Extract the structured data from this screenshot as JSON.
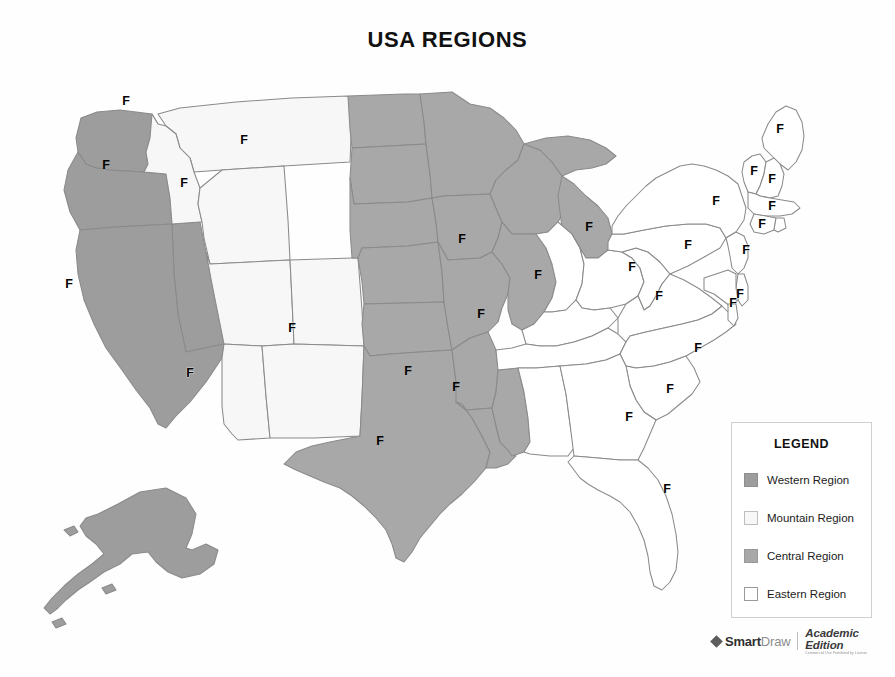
{
  "page": {
    "title": "USA REGIONS",
    "background_color": "#ffffff"
  },
  "colors": {
    "western_region": "#9d9d9d",
    "mountain_region": "#f7f7f7",
    "central_region": "#a8a8a8",
    "eastern_region": "#ffffff",
    "state_border": "#8a8a8a",
    "label_text": "#000000",
    "legend_border": "#cfcfcf"
  },
  "legend": {
    "title": "LEGEND",
    "items": [
      {
        "label": "Western Region",
        "swatch": "#9d9d9d",
        "swatch_name": "swatch-western"
      },
      {
        "label": "Mountain Region",
        "swatch": "#f7f7f7",
        "swatch_name": "swatch-mountain"
      },
      {
        "label": "Central Region",
        "swatch": "#a8a8a8",
        "swatch_name": "swatch-central"
      },
      {
        "label": "Eastern Region",
        "swatch": "#ffffff",
        "swatch_name": "swatch-eastern"
      }
    ]
  },
  "watermark": {
    "brand_bold": "Smart",
    "brand_light": "Draw",
    "edition": "Academic Edition",
    "edition_sub": "Commercial Use Prohibited by License",
    "logo_icon": "diamond-icon"
  },
  "map_data": {
    "type": "choropleth-map",
    "projection": "usa-albers-like",
    "label_text": "F",
    "regions": [
      {
        "key": "west",
        "name": "Western Region",
        "fill": "#9d9d9d"
      },
      {
        "key": "mountain",
        "name": "Mountain Region",
        "fill": "#f7f7f7"
      },
      {
        "key": "central",
        "name": "Central Region",
        "fill": "#a8a8a8"
      },
      {
        "key": "east",
        "name": "Eastern Region",
        "fill": "#ffffff"
      }
    ],
    "states": [
      {
        "code": "WA",
        "name": "Washington",
        "region": "west",
        "label": "F",
        "lx": 126,
        "ly": 50
      },
      {
        "code": "OR",
        "name": "Oregon",
        "region": "west",
        "label": "F",
        "lx": 106,
        "ly": 114
      },
      {
        "code": "CA",
        "name": "California",
        "region": "west",
        "label": "F",
        "lx": 69,
        "ly": 233
      },
      {
        "code": "NV",
        "name": "Nevada",
        "region": "west",
        "label": "",
        "lx": 0,
        "ly": 0
      },
      {
        "code": "AK",
        "name": "Alaska",
        "region": "west",
        "label": "",
        "lx": 0,
        "ly": 0
      },
      {
        "code": "HI",
        "name": "Hawaii",
        "region": "west",
        "label": "",
        "lx": 0,
        "ly": 0
      },
      {
        "code": "ID",
        "name": "Idaho",
        "region": "mountain",
        "label": "F",
        "lx": 184,
        "ly": 132
      },
      {
        "code": "MT",
        "name": "Montana",
        "region": "mountain",
        "label": "F",
        "lx": 244,
        "ly": 89
      },
      {
        "code": "WY",
        "name": "Wyoming",
        "region": "mountain",
        "label": "",
        "lx": 0,
        "ly": 0
      },
      {
        "code": "UT",
        "name": "Utah",
        "region": "mountain",
        "label": "",
        "lx": 0,
        "ly": 0
      },
      {
        "code": "CO",
        "name": "Colorado",
        "region": "mountain",
        "label": "F",
        "lx": 292,
        "ly": 277
      },
      {
        "code": "AZ",
        "name": "Arizona",
        "region": "mountain",
        "label": "F",
        "lx": 190,
        "ly": 322
      },
      {
        "code": "NM",
        "name": "New Mexico",
        "region": "mountain",
        "label": "",
        "lx": 0,
        "ly": 0
      },
      {
        "code": "ND",
        "name": "North Dakota",
        "region": "central",
        "label": "",
        "lx": 0,
        "ly": 0
      },
      {
        "code": "SD",
        "name": "South Dakota",
        "region": "central",
        "label": "",
        "lx": 0,
        "ly": 0
      },
      {
        "code": "NE",
        "name": "Nebraska",
        "region": "central",
        "label": "",
        "lx": 0,
        "ly": 0
      },
      {
        "code": "KS",
        "name": "Kansas",
        "region": "central",
        "label": "",
        "lx": 0,
        "ly": 0
      },
      {
        "code": "OK",
        "name": "Oklahoma",
        "region": "central",
        "label": "F",
        "lx": 408,
        "ly": 320
      },
      {
        "code": "TX",
        "name": "Texas",
        "region": "central",
        "label": "F",
        "lx": 380,
        "ly": 390
      },
      {
        "code": "MN",
        "name": "Minnesota",
        "region": "central",
        "label": "",
        "lx": 0,
        "ly": 0
      },
      {
        "code": "IA",
        "name": "Iowa",
        "region": "central",
        "label": "F",
        "lx": 462,
        "ly": 188
      },
      {
        "code": "MO",
        "name": "Missouri",
        "region": "central",
        "label": "F",
        "lx": 481,
        "ly": 263
      },
      {
        "code": "AR",
        "name": "Arkansas",
        "region": "central",
        "label": "F",
        "lx": 456,
        "ly": 336
      },
      {
        "code": "LA",
        "name": "Louisiana",
        "region": "central",
        "label": "",
        "lx": 0,
        "ly": 0
      },
      {
        "code": "MS",
        "name": "Mississippi",
        "region": "central",
        "label": "",
        "lx": 0,
        "ly": 0
      },
      {
        "code": "WI",
        "name": "Wisconsin",
        "region": "central",
        "label": "",
        "lx": 0,
        "ly": 0
      },
      {
        "code": "IL",
        "name": "Illinois",
        "region": "central",
        "label": "F",
        "lx": 538,
        "ly": 224
      },
      {
        "code": "MI",
        "name": "Michigan",
        "region": "central",
        "label": "F",
        "lx": 589,
        "ly": 176
      },
      {
        "code": "IN",
        "name": "Indiana",
        "region": "east",
        "label": "",
        "lx": 0,
        "ly": 0
      },
      {
        "code": "OH",
        "name": "Ohio",
        "region": "east",
        "label": "F",
        "lx": 632,
        "ly": 216
      },
      {
        "code": "KY",
        "name": "Kentucky",
        "region": "east",
        "label": "",
        "lx": 0,
        "ly": 0
      },
      {
        "code": "TN",
        "name": "Tennessee",
        "region": "east",
        "label": "",
        "lx": 0,
        "ly": 0
      },
      {
        "code": "AL",
        "name": "Alabama",
        "region": "east",
        "label": "",
        "lx": 0,
        "ly": 0
      },
      {
        "code": "WV",
        "name": "West Virginia",
        "region": "east",
        "label": "F",
        "lx": 659,
        "ly": 245
      },
      {
        "code": "VA",
        "name": "Virginia",
        "region": "east",
        "label": "",
        "lx": 0,
        "ly": 0
      },
      {
        "code": "NC",
        "name": "North Carolina",
        "region": "east",
        "label": "F",
        "lx": 698,
        "ly": 297
      },
      {
        "code": "SC",
        "name": "South Carolina",
        "region": "east",
        "label": "F",
        "lx": 670,
        "ly": 338
      },
      {
        "code": "GA",
        "name": "Georgia",
        "region": "east",
        "label": "F",
        "lx": 629,
        "ly": 366
      },
      {
        "code": "FL",
        "name": "Florida",
        "region": "east",
        "label": "F",
        "lx": 667,
        "ly": 438
      },
      {
        "code": "PA",
        "name": "Pennsylvania",
        "region": "east",
        "label": "F",
        "lx": 688,
        "ly": 194
      },
      {
        "code": "NY",
        "name": "New York",
        "region": "east",
        "label": "F",
        "lx": 716,
        "ly": 150
      },
      {
        "code": "ME",
        "name": "Maine",
        "region": "east",
        "label": "F",
        "lx": 780,
        "ly": 78
      },
      {
        "code": "VT",
        "name": "Vermont",
        "region": "east",
        "label": "F",
        "lx": 754,
        "ly": 120
      },
      {
        "code": "NH",
        "name": "New Hampshire",
        "region": "east",
        "label": "F",
        "lx": 772,
        "ly": 128
      },
      {
        "code": "MA",
        "name": "Massachusetts",
        "region": "east",
        "label": "F",
        "lx": 772,
        "ly": 155
      },
      {
        "code": "CT",
        "name": "Connecticut",
        "region": "east",
        "label": "F",
        "lx": 762,
        "ly": 173
      },
      {
        "code": "RI",
        "name": "Rhode Island",
        "region": "east",
        "label": "",
        "lx": 0,
        "ly": 0
      },
      {
        "code": "NJ",
        "name": "New Jersey",
        "region": "east",
        "label": "F",
        "lx": 746,
        "ly": 199
      },
      {
        "code": "DE",
        "name": "Delaware",
        "region": "east",
        "label": "F",
        "lx": 740,
        "ly": 243
      },
      {
        "code": "MD",
        "name": "Maryland",
        "region": "east",
        "label": "F",
        "lx": 733,
        "ly": 252
      }
    ]
  }
}
